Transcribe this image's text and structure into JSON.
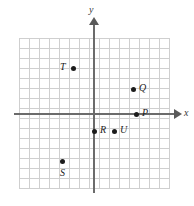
{
  "figure": {
    "width": 194,
    "height": 206,
    "background_color": "#ffffff",
    "type": "coordinate-plane"
  },
  "axes": {
    "x_label": "x",
    "y_label": "y",
    "color": "#6b6b6b",
    "origin_px": [
      94,
      114
    ],
    "units_per_cell": 1,
    "px_per_cell": 10
  },
  "grid": {
    "color": "#cfcfcf",
    "cols": 15,
    "rows": 15,
    "left_px": 19,
    "top_px": 38,
    "width_px": 150,
    "height_px": 150
  },
  "chart_data": {
    "type": "scatter",
    "title": "",
    "xlabel": "x",
    "ylabel": "y",
    "xlim": [
      -7.5,
      7.5
    ],
    "ylim": [
      -7.5,
      7.5
    ],
    "grid": true,
    "legend": "none",
    "point_color": "#1c1c1c",
    "points": [
      {
        "label": "T",
        "x": -2,
        "y": 4.6,
        "dot_px": [
          71,
          66
        ],
        "label_px": [
          60,
          62
        ],
        "label_side": "left"
      },
      {
        "label": "Q",
        "x": 4,
        "y": 2.5,
        "dot_px": [
          131,
          87
        ],
        "label_px": [
          139,
          83
        ],
        "label_side": "right"
      },
      {
        "label": "P",
        "x": 4.2,
        "y": 0,
        "dot_px": [
          134,
          112
        ],
        "label_px": [
          142,
          108
        ],
        "label_side": "right"
      },
      {
        "label": "R",
        "x": 0,
        "y": -1.7,
        "dot_px": [
          92,
          129
        ],
        "label_px": [
          100,
          125
        ],
        "label_side": "right"
      },
      {
        "label": "U",
        "x": 2,
        "y": -1.7,
        "dot_px": [
          112,
          129
        ],
        "label_px": [
          120,
          125
        ],
        "label_side": "right"
      },
      {
        "label": "S",
        "x": -3.2,
        "y": -4.7,
        "dot_px": [
          60,
          159
        ],
        "label_px": [
          60,
          168
        ],
        "label_side": "below"
      }
    ]
  }
}
